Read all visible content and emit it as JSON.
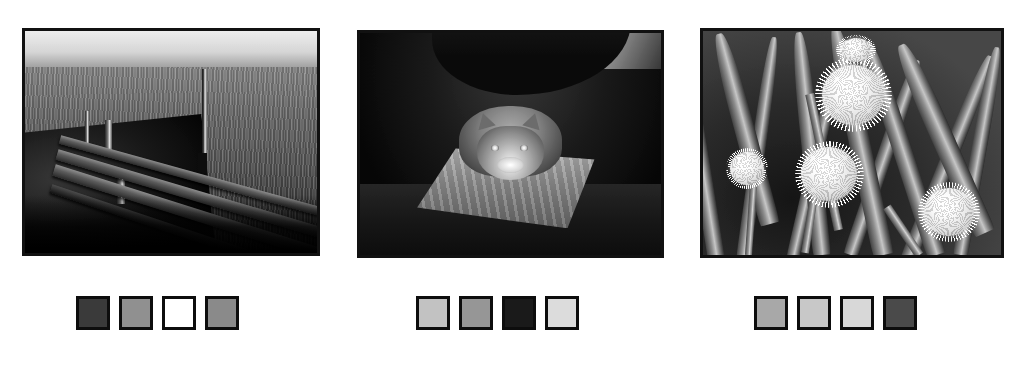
{
  "page": {
    "background_color": "#ffffff",
    "width": 1026,
    "height": 371
  },
  "panels": [
    {
      "id": "panel-jetty",
      "image": {
        "name": "wooden-jetty-over-water-photo",
        "caption": "Black and white photograph of a wooden plank jetty running out over choppy water toward a lone mooring post on the horizon",
        "subject": "jetty",
        "border_color": "#111111",
        "frame": {
          "left": 22,
          "top": 28,
          "width": 298,
          "height": 228
        }
      },
      "swatches": {
        "name": "palette-row-jetty",
        "frame": {
          "left": 76,
          "top": 296,
          "width": 181,
          "height": 34
        },
        "colors": [
          "#3a3a3a",
          "#909090",
          "#ffffff",
          "#8a8a8a"
        ],
        "labels": [
          "swatch-1",
          "swatch-2",
          "swatch-3",
          "swatch-4"
        ]
      }
    },
    {
      "id": "panel-cat",
      "image": {
        "name": "cat-on-cushion-photo",
        "caption": "Black and white photograph of a tabby cat crouched on a flat cushion in a dark interior",
        "subject": "cat",
        "border_color": "#111111",
        "frame": {
          "left": 357,
          "top": 30,
          "width": 307,
          "height": 228
        }
      },
      "swatches": {
        "name": "palette-row-cat",
        "frame": {
          "left": 416,
          "top": 296,
          "width": 181,
          "height": 34
        },
        "colors": [
          "#c2c2c2",
          "#969696",
          "#1a1a1a",
          "#dcdcdc"
        ],
        "labels": [
          "swatch-1",
          "swatch-2",
          "swatch-3",
          "swatch-4"
        ]
      }
    },
    {
      "id": "panel-alliums",
      "image": {
        "name": "allium-onion-flowers-photo",
        "caption": "Black and white photograph of round allium / onion flower heads on tall stems among broad leaves",
        "subject": "alliums",
        "border_color": "#111111",
        "frame": {
          "left": 700,
          "top": 28,
          "width": 304,
          "height": 230
        }
      },
      "swatches": {
        "name": "palette-row-alliums",
        "frame": {
          "left": 754,
          "top": 296,
          "width": 181,
          "height": 34
        },
        "colors": [
          "#a8a8a8",
          "#c8c8c8",
          "#d8d8d8",
          "#4a4a4a"
        ],
        "labels": [
          "swatch-1",
          "swatch-2",
          "swatch-3",
          "swatch-4"
        ]
      }
    }
  ]
}
